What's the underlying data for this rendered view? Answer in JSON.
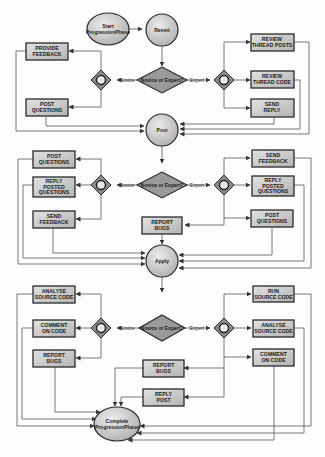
{
  "diagram": {
    "type": "flowchart",
    "colors": {
      "node_fill": "#c8c8c8",
      "stroke": "#2a2a2a",
      "edge": "#555555",
      "decision_fill": "#9a9a9a"
    },
    "start": {
      "label_line1": "Start",
      "label_line2": "ProgressionPhase"
    },
    "revert": {
      "label": "Revert"
    },
    "post": {
      "label": "Post"
    },
    "apply": {
      "label": "Apply"
    },
    "complete": {
      "label_line1": "Complete",
      "label_line2": "ProgressionPhase"
    },
    "decision_label": "Novice or Expert?",
    "novice_label": "Novice",
    "expert_label": "Expert",
    "phase1": {
      "novice": [
        {
          "line1": "PROVIDE",
          "line2": "FEEDBACK"
        },
        {
          "line1": "POST",
          "line2": "QUESTIONS"
        }
      ],
      "expert": [
        {
          "line1": "REVIEW",
          "line2": "THREAD POSTS"
        },
        {
          "line1": "REVIEW",
          "line2": "THREAD CODE"
        },
        {
          "line1": "SEND",
          "line2": "REPLY"
        }
      ]
    },
    "phase2": {
      "novice": [
        {
          "line1": "POST",
          "line2": "QUESTIONS"
        },
        {
          "line1": "REPLY",
          "line2": "POSTED",
          "line3": "QUESTIONS"
        },
        {
          "line1": "SEND",
          "line2": "FEEDBACK"
        }
      ],
      "expert": [
        {
          "line1": "SEND",
          "line2": "FEEDBACK"
        },
        {
          "line1": "REPLY",
          "line2": "POSTED",
          "line3": "QUESTIONS"
        },
        {
          "line1": "POST",
          "line2": "QUESTIONS"
        },
        {
          "line1": "REPORT",
          "line2": "BUGS"
        }
      ]
    },
    "phase3": {
      "novice": [
        {
          "line1": "ANALYSE",
          "line2": "SOURCE CODE"
        },
        {
          "line1": "COMMENT",
          "line2": "ON CODE"
        },
        {
          "line1": "REPORT",
          "line2": "BUGS"
        }
      ],
      "expert": [
        {
          "line1": "RUN",
          "line2": "SOURCE CODE"
        },
        {
          "line1": "ANALYSE",
          "line2": "SOURCE CODE"
        },
        {
          "line1": "COMMENT",
          "line2": "ON CODE"
        },
        {
          "line1": "REPORT",
          "line2": "BUGS"
        },
        {
          "line1": "REPLY",
          "line2": "POST"
        }
      ]
    }
  }
}
